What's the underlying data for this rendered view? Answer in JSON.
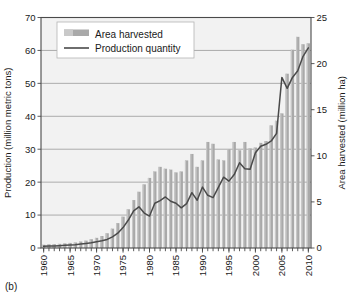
{
  "figure": {
    "panel_label": "(b)",
    "legend": {
      "items": [
        {
          "label": "Area harvested",
          "type": "bar",
          "color": "#a9a9a9"
        },
        {
          "label": "Production quantity",
          "type": "line",
          "color": "#4a4a4a"
        }
      ]
    },
    "colors": {
      "bar": "#a9a9a9",
      "line": "#4a4a4a",
      "plot_background": "#f2f2f2",
      "gridline": "#8c8c8c",
      "frame": "#4a4a4a"
    }
  },
  "chart_data": {
    "type": "bar",
    "title": "",
    "xlabel": "",
    "ylabel": "Production (million metric tons)",
    "y2label": "Area harvested (million ha)",
    "ylim": [
      0,
      70
    ],
    "y2lim": [
      0,
      25
    ],
    "xlim": [
      1960,
      2010
    ],
    "yticks": [
      0,
      10,
      20,
      30,
      40,
      50,
      60,
      70
    ],
    "y2ticks": [
      0,
      5,
      10,
      15,
      20,
      25
    ],
    "xticks": [
      1960,
      1965,
      1970,
      1975,
      1980,
      1985,
      1990,
      1995,
      2000,
      2005,
      2010
    ],
    "xtick_labels": [
      "1960",
      "1965",
      "1970",
      "1975",
      "1980",
      "1985",
      "1990",
      "1995",
      "2000",
      "2005",
      "2010"
    ],
    "ytick_labels": [
      "0",
      "10",
      "20",
      "30",
      "40",
      "50",
      "60",
      "70"
    ],
    "y2tick_labels": [
      "0",
      "5",
      "10",
      "15",
      "20",
      "25"
    ],
    "grid": true,
    "legend_position": "upper-left-inside",
    "x": [
      1960,
      1961,
      1962,
      1963,
      1964,
      1965,
      1966,
      1967,
      1968,
      1969,
      1970,
      1971,
      1972,
      1973,
      1974,
      1975,
      1976,
      1977,
      1978,
      1979,
      1980,
      1981,
      1982,
      1983,
      1984,
      1985,
      1986,
      1987,
      1988,
      1989,
      1990,
      1991,
      1992,
      1993,
      1994,
      1995,
      1996,
      1997,
      1998,
      1999,
      2000,
      2001,
      2002,
      2003,
      2004,
      2005,
      2006,
      2007,
      2008,
      2009,
      2010
    ],
    "series": [
      {
        "name": "Area harvested",
        "axis": "right",
        "unit": "million ha",
        "type": "bar",
        "values": [
          0.35,
          0.4,
          0.42,
          0.45,
          0.5,
          0.55,
          0.6,
          0.7,
          0.8,
          0.95,
          1.1,
          1.3,
          1.6,
          2.1,
          2.7,
          3.4,
          4.2,
          5.2,
          6.1,
          6.9,
          7.6,
          8.3,
          8.8,
          8.6,
          8.5,
          8.2,
          8.3,
          9.5,
          10.2,
          8.8,
          9.5,
          11.5,
          11.3,
          9.6,
          9.5,
          10.7,
          11.5,
          10.6,
          11.5,
          10.8,
          10.9,
          11.4,
          11.6,
          13.3,
          13.8,
          14.6,
          18.9,
          21.5,
          22.9,
          22.1,
          22.2
        ]
      },
      {
        "name": "Production quantity",
        "axis": "left",
        "unit": "million metric tons",
        "type": "line",
        "values": [
          0.5,
          0.6,
          0.6,
          0.7,
          0.8,
          0.9,
          1.0,
          1.2,
          1.4,
          1.6,
          1.9,
          2.2,
          2.6,
          3.4,
          4.5,
          6.2,
          8.5,
          11.3,
          12.5,
          10.6,
          9.7,
          13.6,
          14.4,
          15.5,
          14.2,
          13.6,
          12.2,
          13.5,
          16.8,
          14.5,
          18.5,
          16.0,
          15.3,
          18.4,
          21.5,
          20.3,
          22.3,
          25.9,
          24.1,
          23.9,
          28.9,
          30.9,
          31.5,
          32.5,
          34.8,
          51.8,
          48.5,
          51.8,
          53.8,
          58.2,
          60.8
        ]
      }
    ]
  }
}
